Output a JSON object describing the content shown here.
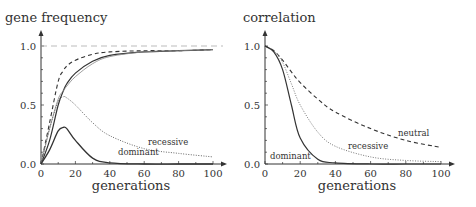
{
  "chart_data": [
    {
      "type": "line",
      "title": "gene frequency",
      "ylabel": "gene frequency",
      "xlabel": "generations",
      "xlim": [
        0,
        100
      ],
      "ylim": [
        0,
        1
      ],
      "xticks": [
        "0",
        "20",
        "40",
        "60",
        "80",
        "100"
      ],
      "yticks": [
        "0.0",
        "0.5",
        "1.0"
      ],
      "reference_line": {
        "y": 1.0,
        "style": "dashed"
      },
      "x": [
        0,
        5,
        10,
        13,
        15,
        20,
        30,
        40,
        60,
        80,
        100
      ],
      "series": [
        {
          "name": "neutral (dashed)",
          "values": [
            0,
            0.35,
            0.7,
            0.79,
            0.83,
            0.88,
            0.93,
            0.95,
            0.96,
            0.96,
            0.97
          ]
        },
        {
          "name": "total dominant",
          "values": [
            0,
            0.2,
            0.5,
            0.62,
            0.68,
            0.77,
            0.87,
            0.92,
            0.95,
            0.96,
            0.97
          ]
        },
        {
          "name": "total recessive",
          "values": [
            0,
            0.3,
            0.55,
            0.62,
            0.66,
            0.74,
            0.85,
            0.91,
            0.95,
            0.96,
            0.97
          ]
        },
        {
          "name": "recessive",
          "values": [
            0,
            0.3,
            0.53,
            0.57,
            0.56,
            0.5,
            0.35,
            0.24,
            0.13,
            0.09,
            0.06
          ]
        },
        {
          "name": "dominant",
          "values": [
            0,
            0.12,
            0.28,
            0.31,
            0.3,
            0.2,
            0.05,
            0.01,
            0,
            0,
            0
          ]
        }
      ],
      "annotations": [
        "dominant",
        "recessive"
      ]
    },
    {
      "type": "line",
      "title": "correlation",
      "ylabel": "correlation",
      "xlabel": "generations",
      "xlim": [
        0,
        100
      ],
      "ylim": [
        0,
        1
      ],
      "xticks": [
        "0",
        "20",
        "40",
        "60",
        "80",
        "100"
      ],
      "yticks": [
        "0.0",
        "0.5",
        "1.0"
      ],
      "x": [
        0,
        5,
        10,
        15,
        20,
        30,
        40,
        60,
        80,
        100
      ],
      "series": [
        {
          "name": "neutral",
          "values": [
            1,
            0.96,
            0.88,
            0.78,
            0.69,
            0.55,
            0.44,
            0.3,
            0.2,
            0.14
          ]
        },
        {
          "name": "recessive",
          "values": [
            1,
            0.96,
            0.86,
            0.68,
            0.5,
            0.27,
            0.15,
            0.06,
            0.03,
            0.02
          ]
        },
        {
          "name": "dominant",
          "values": [
            1,
            0.95,
            0.8,
            0.5,
            0.22,
            0.04,
            0.01,
            0,
            0,
            0
          ]
        }
      ],
      "annotations": [
        "neutral",
        "recessive",
        "dominant"
      ]
    }
  ]
}
